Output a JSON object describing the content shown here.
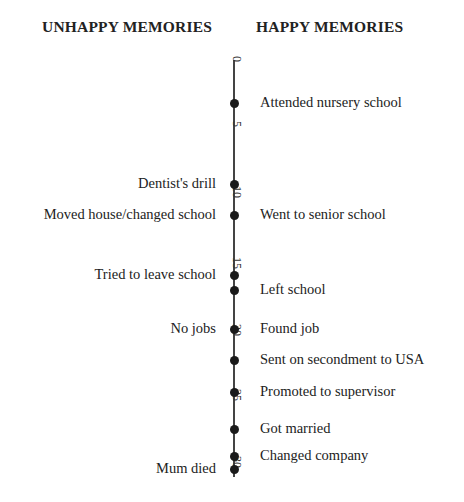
{
  "headers": {
    "unhappy": "UNHAPPY MEMORIES",
    "happy": "HAPPY MEMORIES"
  },
  "axis": {
    "label": "Age (years)",
    "ticks": [
      {
        "value": "0",
        "y": 62
      },
      {
        "value": "5",
        "y": 127
      },
      {
        "value": "10",
        "y": 192
      },
      {
        "value": "15",
        "y": 263
      },
      {
        "value": "20",
        "y": 330
      },
      {
        "value": "25",
        "y": 395
      },
      {
        "value": "30",
        "y": 462
      }
    ]
  },
  "events": [
    {
      "age": 3,
      "y": 103,
      "side": "happy",
      "label": "Attended nursery school"
    },
    {
      "age": 9,
      "y": 184,
      "side": "unhappy",
      "label": "Dentist's drill"
    },
    {
      "age": 11,
      "y": 215,
      "side": "unhappy",
      "label": "Moved house/changed school"
    },
    {
      "age": 11,
      "y": 215,
      "side": "happy",
      "label": "Went to senior school"
    },
    {
      "age": 16,
      "y": 275,
      "side": "unhappy",
      "label": "Tried to leave school"
    },
    {
      "age": 16,
      "y": 290,
      "side": "happy",
      "label": "Left school"
    },
    {
      "age": 20,
      "y": 329,
      "side": "unhappy",
      "label": "No jobs"
    },
    {
      "age": 20,
      "y": 329,
      "side": "happy",
      "label": "Found job"
    },
    {
      "age": 22,
      "y": 360,
      "side": "happy",
      "label": "Sent on secondment to USA"
    },
    {
      "age": 25,
      "y": 392,
      "side": "happy",
      "label": "Promoted to supervisor"
    },
    {
      "age": 28,
      "y": 429,
      "side": "happy",
      "label": "Got married"
    },
    {
      "age": 30,
      "y": 456,
      "side": "happy",
      "label": "Changed company"
    },
    {
      "age": 31,
      "y": 469,
      "side": "unhappy",
      "label": "Mum died"
    }
  ],
  "colors": {
    "line": "#444444",
    "dot": "#1a1a1a",
    "text": "#222222"
  }
}
